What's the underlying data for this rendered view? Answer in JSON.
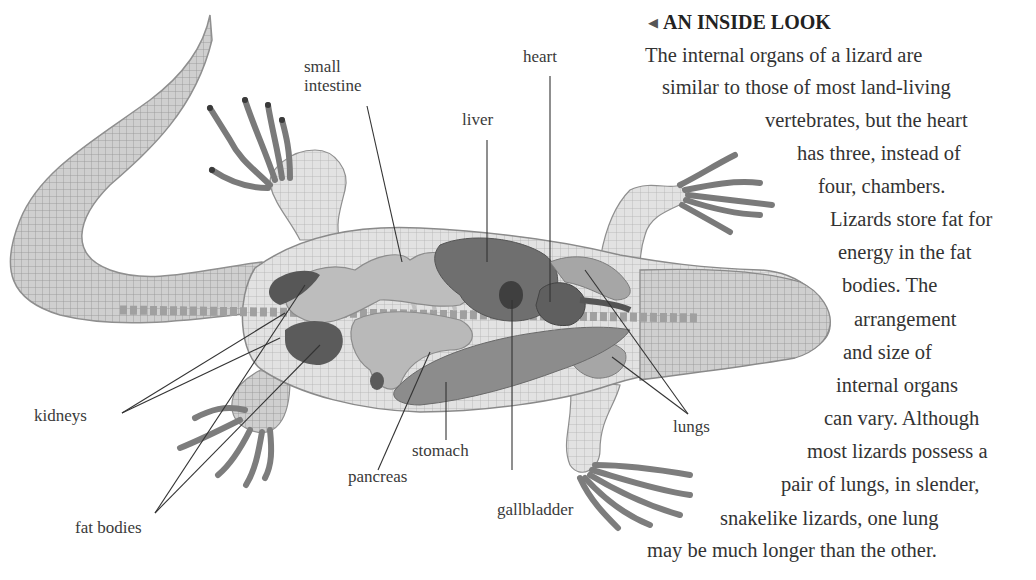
{
  "figure": {
    "labels": [
      {
        "id": "small-intestine",
        "text": "small intestine",
        "lines": [
          "small",
          "intestine"
        ]
      },
      {
        "id": "heart",
        "text": "heart"
      },
      {
        "id": "liver",
        "text": "liver"
      },
      {
        "id": "kidneys",
        "text": "kidneys"
      },
      {
        "id": "lungs",
        "text": "lungs"
      },
      {
        "id": "stomach",
        "text": "stomach"
      },
      {
        "id": "pancreas",
        "text": "pancreas"
      },
      {
        "id": "gallbladder",
        "text": "gallbladder"
      },
      {
        "id": "fat-bodies",
        "text": "fat bodies"
      }
    ],
    "colors": {
      "skin": "#c8c8c8",
      "skin_dark": "#8a8a8a",
      "organ_light": "#bdbdbd",
      "organ_mid": "#8c8c8c",
      "organ_dark": "#5f5f5f",
      "organ_darkest": "#3f3f3f",
      "leader_line": "#333333"
    }
  },
  "panel": {
    "title_icon": "left-triangle-icon",
    "title": "AN INSIDE LOOK",
    "lines": [
      "The internal organs of a lizard are",
      "similar to those of most land-living",
      "vertebrates, but the heart",
      "has three, instead of",
      "four, chambers.",
      "Lizards store fat for",
      "energy in the fat",
      "bodies. The",
      "arrangement",
      "and size of",
      "internal organs",
      "can vary. Although",
      "most lizards possess a",
      "pair of lungs, in slender,",
      "snakelike lizards, one lung",
      "may be much longer than the other."
    ]
  }
}
